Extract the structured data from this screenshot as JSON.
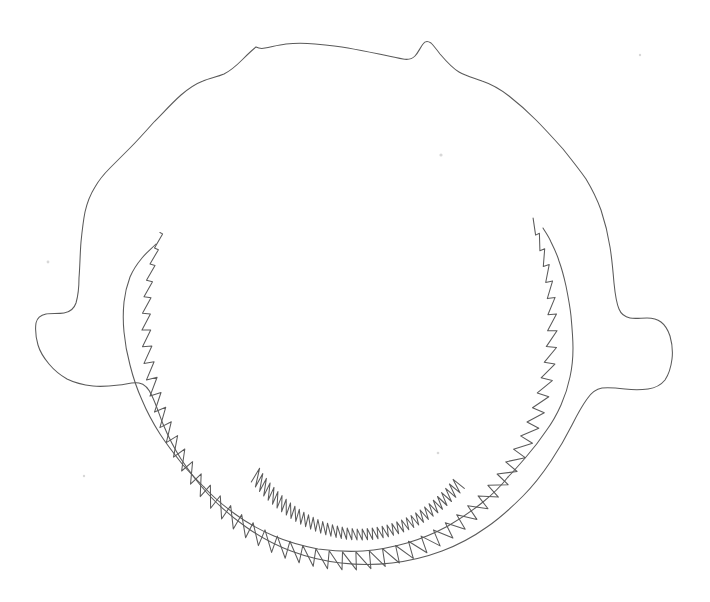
{
  "figure": {
    "view": "anterior",
    "medium": "line-drawing",
    "background_color": "#ffffff",
    "ink_color": "#5a5a5a",
    "stroke_width": 1.05,
    "canvas": {
      "width": 710,
      "height": 602
    },
    "visible_text": "",
    "caption": ""
  },
  "geometry": {
    "bounds": {
      "left": 36,
      "top": 33,
      "right": 672,
      "bottom": 565
    },
    "outer_outline_path": "M 256 47 C 252 50 247 55 242 60 C 236 66 230 71 224 74 C 217 77 210 78 203 81 C 195 84 188 89 181 95 C 172 103 163 113 154 122 C 146 131 138 140 130 148 C 123 155 116 162 110 168 C 104 174 99 180 95 187 C 90 195 87 203 85 212 C 83 222 82 232 81 242 C 80 254 80 266 79 278 C 79 288 78 296 76 303 C 74 309 70 312 64 313 C 58 314 51 313 46 314 C 41 315 37 318 36 323 C 35 330 36 338 38 345 C 40 352 44 358 49 364 C 54 370 60 375 67 379 C 75 383 84 385 93 386 C 102 387 111 386 119 385 C 127 384 133 382 139 383 C 145 384 149 389 152 396 C 156 404 159 414 163 424 C 168 436 174 448 181 459 C 189 471 198 483 208 494 C 219 506 232 517 246 527 C 260 537 275 545 291 551 C 307 557 324 561 341 563 C 358 565 375 565 392 563 C 409 561 426 557 442 551 C 458 545 473 537 487 527 C 500 518 512 507 523 496 C 534 485 543 473 551 461 C 559 449 566 437 572 425 C 577 415 582 406 587 399 C 591 393 596 389 602 388 C 609 387 617 388 625 389 C 633 390 641 390 648 389 C 655 388 661 385 665 380 C 669 374 671 367 672 359 C 673 351 672 343 670 336 C 668 330 665 325 661 322 C 657 319 652 318 647 318 C 641 318 635 319 630 318 C 625 317 621 314 619 309 C 616 302 615 293 614 283 C 613 271 612 259 610 247 C 608 234 605 222 601 210 C 597 199 592 189 586 179 C 579 169 571 159 563 149 C 554 139 545 129 536 120 C 527 111 518 103 509 96 C 500 89 491 84 482 81 C 474 78 466 76 459 72 C 452 68 446 61 440 54 C 437 50 434 46 431 43 C 428 41 425 41 423 44 C 420 48 418 53 415 56 C 412 59 408 60 403 59 C 396 58 388 56 379 54 C 369 52 359 50 348 48 C 337 46 326 45 315 44 C 305 43 295 43 286 44 C 278 45 271 47 265 48 C 261 49 258 48 256 47 Z",
    "inner_left_rim_path": "M 156 244 C 151 249 146 253 142 258 C 137 264 133 270 130 277 C 127 285 125 293 124 302 C 123 312 123 322 124 332 C 125 343 127 354 130 365 C 133 377 137 389 142 400 C 147 412 153 423 160 434 C 167 445 175 455 183 465 C 190 473 197 480 204 487",
    "inner_right_rim_path": "M 543 228 C 546 233 549 237 551 242 C 554 248 557 254 559 261 C 562 269 564 277 566 286 C 568 296 570 306 571 316 C 572 327 573 338 573 348 C 573 358 572 368 570 377 C 568 387 565 396 561 405 C 557 414 552 423 546 431 C 540 440 533 449 526 457 C 520 464 514 471 508 477",
    "lower_jaw_inner_path": "M 204 487 C 213 497 224 506 235 514 C 247 523 260 530 274 536 C 288 542 303 546 318 549 C 333 551 348 552 363 551 C 378 550 393 547 407 543 C 421 539 435 533 448 526 C 460 519 472 511 483 502 C 493 494 501 486 508 477",
    "upper_tooth_row": {
      "description": "serrated tooth row along upper jaw, teeth largest at apex, shrinking toward each hinge",
      "apex_y": 90,
      "left_end": {
        "x": 156,
        "y": 244
      },
      "right_end": {
        "x": 543,
        "y": 228
      },
      "tooth_count": 58
    },
    "lower_tooth_row": {
      "description": "serrated tooth row along lower jaw, teeth point upward into mouth cavity",
      "left_end": {
        "x": 205,
        "y": 481
      },
      "right_end": {
        "x": 516,
        "y": 497
      },
      "deepest_y": 540,
      "tooth_count": 44
    },
    "apex_bumps": [
      {
        "label": "left-symphysis-bump",
        "x": 258,
        "y": 39
      },
      {
        "label": "right-symphysis-bump",
        "x": 460,
        "y": 36
      }
    ],
    "hinge_lobes": [
      {
        "label": "left-hinge-lobe",
        "x": 36,
        "y": 345
      },
      {
        "label": "right-hinge-lobe",
        "x": 672,
        "y": 352
      }
    ],
    "specks": [
      {
        "x": 441,
        "y": 155,
        "r": 1.6
      },
      {
        "x": 48,
        "y": 262,
        "r": 1.4
      },
      {
        "x": 640,
        "y": 55,
        "r": 1.2
      },
      {
        "x": 438,
        "y": 453,
        "r": 1.3
      },
      {
        "x": 84,
        "y": 476,
        "r": 1.2
      }
    ]
  }
}
